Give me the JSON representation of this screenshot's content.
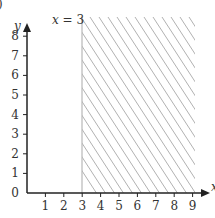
{
  "figure": {
    "part_label_fragment": ")",
    "line_label": "x = 3",
    "x_axis_label": "x",
    "y_axis_label": "y"
  },
  "chart_data": {
    "type": "region",
    "title": "",
    "xlabel": "x",
    "ylabel": "y",
    "xlim": [
      0,
      9
    ],
    "ylim": [
      0,
      8
    ],
    "x_ticks": [
      1,
      2,
      3,
      4,
      5,
      6,
      7,
      8,
      9
    ],
    "y_ticks": [
      0,
      1,
      2,
      3,
      4,
      5,
      6,
      7,
      8
    ],
    "grid": false,
    "boundary": {
      "type": "vertical_line",
      "x": 3,
      "label": "x = 3",
      "style": "solid",
      "color": "#b0b0b0"
    },
    "shaded_region": {
      "inequality": "x >= 3",
      "x_range": [
        3,
        9.6
      ],
      "y_range": [
        0,
        9
      ],
      "pattern": "diagonal hatch (\\)",
      "color": "#a0a0a0"
    },
    "axis_color": "#222222"
  }
}
